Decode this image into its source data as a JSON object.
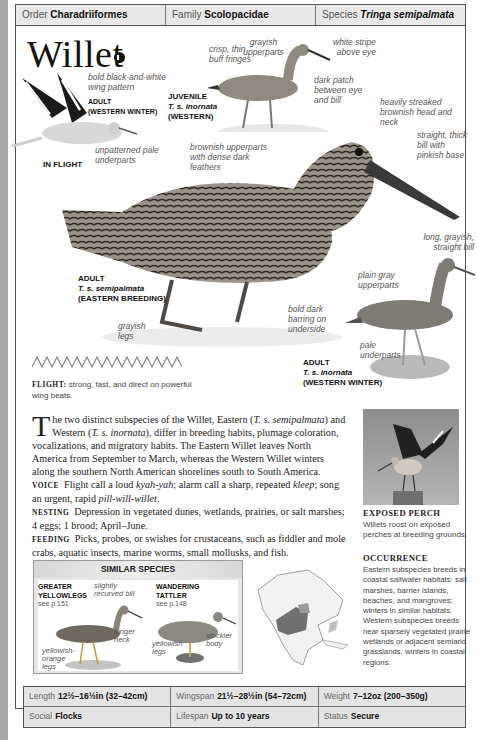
{
  "header": {
    "order": {
      "label": "Order",
      "value": "Charadriiformes"
    },
    "family": {
      "label": "Family",
      "value": "Scolopacidae"
    },
    "species": {
      "label": "Species",
      "value": "Tringa semipalmata"
    }
  },
  "title": "Willet",
  "icons": {
    "sound": "sound-icon"
  },
  "illustration_labels": {
    "wing_pattern": "bold black-and-white wing pattern",
    "flight_adult": "ADULT",
    "flight_adult_sub": "(WESTERN WINTER)",
    "unpatterned": "unpatterned pale underparts",
    "in_flight": "IN FLIGHT",
    "crisp": "crisp, thin buff fringes",
    "grayish_upperparts": "grayish upperparts",
    "white_stripe": "white stripe above eye",
    "dark_patch": "dark patch between eye and bill",
    "juvenile": "JUVENILE",
    "juvenile_sci": "T. s. inornata",
    "juvenile_sub": "(WESTERN)",
    "heavily_streaked": "heavily streaked brownish head and neck",
    "straight_bill": "straight, thick bill with pinkish base",
    "brownish_upperparts": "brownish upperparts with dense dark feathers",
    "adult_east": "ADULT",
    "adult_east_sci": "T. s. semipalmata",
    "adult_east_sub": "(EASTERN BREEDING)",
    "grayish_legs": "grayish legs",
    "bold_barring": "bold dark barring on underside",
    "long_bill": "long, grayish, straight bill",
    "plain_gray": "plain gray upperparts",
    "pale_underparts": "pale underparts",
    "adult_west": "ADULT",
    "adult_west_sci": "T. s. inornata",
    "adult_west_sub": "(WESTERN WINTER)"
  },
  "flight": {
    "label": "FLIGHT:",
    "text": "strong, fast, and direct on powerful wing beats."
  },
  "description": {
    "dropcap": "T",
    "intro_a": "he two distinct subspecies of the Willet, Eastern (",
    "intro_sci1": "T. s. semipalmata",
    "intro_b": ") and Western (",
    "intro_sci2": "T. s. inornata",
    "intro_c": "), differ in breeding habits, plumage coloration, vocalizations, and migratory habits. The Eastern Willet leaves North America from September to March, whereas the Western Willet winters along the southern North American shorelines south to South America.",
    "voice_label": "VOICE",
    "voice_a": "Flight call a loud ",
    "voice_call": "kyah-yah",
    "voice_b": "; alarm call a sharp, repeated ",
    "voice_kleep": "kleep",
    "voice_c": "; song an urgent, rapid ",
    "voice_song": "pill-will-willet",
    "voice_d": ".",
    "nesting_label": "NESTING",
    "nesting_text": "Depression in vegetated dunes, wetlands, prairies, or salt marshes; 4 eggs; 1 brood; April–June.",
    "feeding_label": "FEEDING",
    "feeding_text": "Picks, probes, or swishes for crustaceans, such as fiddler and mole crabs, aquatic insects, marine worms, small mollusks, and fish."
  },
  "photo": {
    "title": "EXPOSED PERCH",
    "caption": "Willets roost on exposed perches at breeding grounds."
  },
  "occurrence": {
    "title": "OCCURRENCE",
    "text": "Eastern subspecies breeds in coastal saltwater habitats: salt marshes, barrier islands, beaches, and mangroves; winters in similar habitats. Western subspecies breeds near sparsely vegetated prairie wetlands or adjacent semiarid grasslands; winters in coastal regions."
  },
  "similar_species": {
    "heading": "SIMILAR SPECIES",
    "species": [
      {
        "name_1": "GREATER",
        "name_2": "YELLOWLEGS",
        "ref": "see p.151",
        "labels": [
          "slightly recurved bill",
          "longer neck",
          "yellowish-orange legs"
        ]
      },
      {
        "name_1": "WANDERING",
        "name_2": "TATTLER",
        "ref": "see p.148",
        "labels": [
          "stockier body",
          "yellowish legs"
        ]
      }
    ]
  },
  "stats": {
    "length": {
      "label": "Length",
      "value": "12½–16½in (32–42cm)"
    },
    "wingspan": {
      "label": "Wingspan",
      "value": "21½–28½in (54–72cm)"
    },
    "weight": {
      "label": "Weight",
      "value": "7–12oz (200–350g)"
    },
    "social": {
      "label": "Social",
      "value": "Flocks"
    },
    "lifespan": {
      "label": "Lifespan",
      "value": "Up to 10 years"
    },
    "status": {
      "label": "Status",
      "value": "Secure"
    }
  }
}
